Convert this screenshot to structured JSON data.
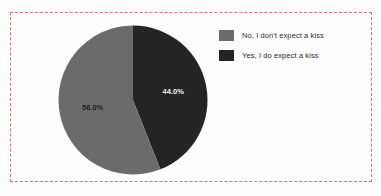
{
  "figure": {
    "clipped_title": "",
    "background_color": "#fdfdfd",
    "frame_color": "#e86b7a"
  },
  "legend": {
    "position": "top-right",
    "items": [
      {
        "label": "No, I don't expect a kiss",
        "color": "#6b6b6b"
      },
      {
        "label": "Yes, I do expect a kiss",
        "color": "#242424"
      }
    ]
  },
  "chart_data": {
    "type": "pie",
    "title": "",
    "subtitle": "",
    "xlabel": "",
    "ylabel": "",
    "grid": false,
    "legend_position": "top-right",
    "start_angle_deg": 0,
    "direction": "clockwise",
    "categories": [
      "Yes, I do expect a kiss",
      "No, I don't expect a kiss"
    ],
    "values": [
      44.0,
      56.0
    ],
    "labels": [
      "44.0%",
      "56.0%"
    ],
    "colors": [
      "#242424",
      "#6b6b6b"
    ],
    "slices": [
      {
        "name": "Yes, I do expect a kiss",
        "value": 44.0,
        "label": "44.0%",
        "color": "#242424",
        "start_angle_deg": 0,
        "end_angle_deg": 158.4
      },
      {
        "name": "No, I don't expect a kiss",
        "value": 56.0,
        "label": "56.0%",
        "color": "#6b6b6b",
        "start_angle_deg": 158.4,
        "end_angle_deg": 360
      }
    ],
    "units": "percent",
    "total": 100.0
  }
}
